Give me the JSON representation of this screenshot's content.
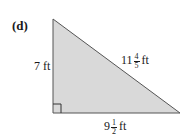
{
  "part_label": "(d)",
  "shape": "right-triangle",
  "colors": {
    "fill": "#d9d9d9",
    "stroke": "#555555",
    "text": "#1a1a1a"
  },
  "sides": {
    "left": {
      "whole": "7",
      "unit": "ft"
    },
    "hypotenuse": {
      "whole": "11",
      "numerator": "4",
      "denominator": "5",
      "unit": "ft"
    },
    "bottom": {
      "whole": "9",
      "numerator": "1",
      "denominator": "2",
      "unit": "ft"
    }
  },
  "right_angle_marker": true
}
